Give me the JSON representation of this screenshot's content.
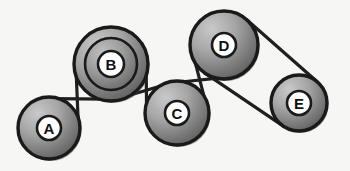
{
  "diagram": {
    "type": "pulley-belt-system",
    "background_color": "#f6f6f4",
    "outline_color": "#1a1a1a",
    "belt_color": "#1f1f1f",
    "disc_light": "#b9b9b9",
    "disc_dark": "#6d6d6d",
    "hub_fill": "#ffffff",
    "label_color": "#111111",
    "pulleys": [
      {
        "id": "A",
        "label": "A",
        "cx": 49,
        "cy": 128,
        "r": 31,
        "hub_r": 12,
        "inner_r": 0,
        "label_size": 15
      },
      {
        "id": "B",
        "label": "B",
        "cx": 111,
        "cy": 64,
        "r": 37,
        "hub_r": 13,
        "inner_r": 26,
        "label_size": 15
      },
      {
        "id": "C",
        "label": "C",
        "cx": 177,
        "cy": 113,
        "r": 32,
        "hub_r": 12,
        "inner_r": 0,
        "label_size": 15
      },
      {
        "id": "D",
        "label": "D",
        "cx": 224,
        "cy": 45,
        "r": 34,
        "hub_r": 12,
        "inner_r": 0,
        "label_size": 15
      },
      {
        "id": "E",
        "label": "E",
        "cx": 299,
        "cy": 103,
        "r": 28,
        "hub_r": 12,
        "inner_r": 0,
        "label_size": 15
      }
    ],
    "belts": [
      {
        "id": "belt-a-b",
        "from": "A",
        "to": "B",
        "style": "crossed"
      },
      {
        "id": "belt-b-c",
        "from": "B",
        "to": "C",
        "style": "crossed"
      },
      {
        "id": "belt-c-d",
        "from": "C",
        "to": "D",
        "style": "crossed"
      },
      {
        "id": "belt-d-e",
        "from": "D",
        "to": "E",
        "style": "open"
      }
    ]
  }
}
